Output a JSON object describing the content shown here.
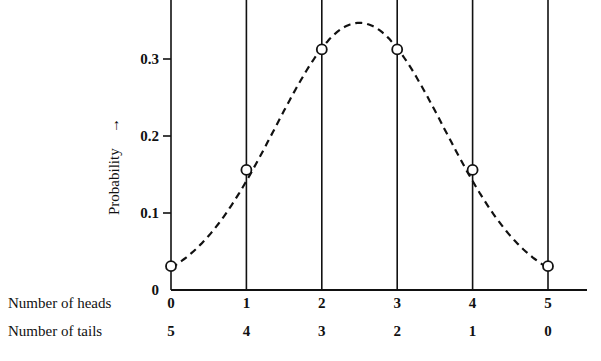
{
  "chart_data": {
    "type": "line",
    "title": "",
    "xlabel": "Number of heads",
    "x_secondary_label": "Number of tails",
    "ylabel": "Probability",
    "ylabel_arrow": "→",
    "x": [
      0,
      1,
      2,
      3,
      4,
      5
    ],
    "x_tick_labels": [
      "0",
      "1",
      "2",
      "3",
      "4",
      "5"
    ],
    "x_secondary_tick_labels": [
      "5",
      "4",
      "3",
      "2",
      "1",
      "0"
    ],
    "y_ticks": [
      0,
      0.1,
      0.2,
      0.3
    ],
    "y_tick_labels": [
      "0",
      "0.1",
      "0.2",
      "0.3"
    ],
    "ylim": [
      0,
      0.37
    ],
    "series": [
      {
        "name": "Binomial probability (5 coin tosses)",
        "values": [
          0.031,
          0.156,
          0.3125,
          0.3125,
          0.156,
          0.031
        ],
        "style": "dashed smooth curve with open circle markers"
      }
    ],
    "grid": "vertical lines at each x category",
    "legend": "none"
  },
  "labels": {
    "row_heads": "Number of heads",
    "row_tails": "Number of tails",
    "y_axis": "Probability",
    "y_arrow": "→"
  }
}
